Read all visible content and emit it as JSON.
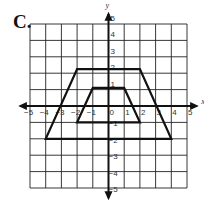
{
  "problem": {
    "label": "C."
  },
  "graph": {
    "x_axis_label": "x",
    "y_axis_label": "y",
    "x_range": [
      -5,
      5
    ],
    "y_range": [
      -5,
      5
    ],
    "x_ticks": [
      "-5",
      "-4",
      "-3",
      "-2",
      "-1",
      "0",
      "1",
      "2",
      "3",
      "4",
      "5"
    ],
    "y_ticks": [
      "5",
      "4",
      "3",
      "2",
      "1",
      "-1",
      "-2",
      "-3",
      "-4",
      "-5"
    ],
    "grid": true,
    "shapes": [
      {
        "name": "large-trapezoid",
        "vertices": [
          [
            -2,
            2
          ],
          [
            2,
            2
          ],
          [
            4,
            -2
          ],
          [
            -4,
            -2
          ]
        ]
      },
      {
        "name": "small-trapezoid",
        "vertices": [
          [
            -1,
            1
          ],
          [
            1,
            1
          ],
          [
            2,
            -1
          ],
          [
            -2,
            -1
          ]
        ]
      }
    ],
    "colors": {
      "grid": "#222222",
      "axes": "#111111",
      "shape": "#111111",
      "text": "#333333"
    }
  }
}
